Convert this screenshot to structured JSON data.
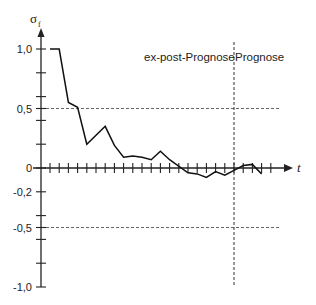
{
  "chart_data": {
    "type": "line",
    "title": "",
    "xlabel": "t",
    "ylabel": "σ_f",
    "ylabel_main": "σ",
    "ylabel_sub": "f",
    "ylim": [
      -1.0,
      1.0
    ],
    "y_tick_labels": [
      "1,0",
      "0,5",
      "0",
      "-0,2",
      "-0,5",
      "-1,0"
    ],
    "y_tick_values": [
      1.0,
      0.5,
      0,
      -0.2,
      -0.5,
      -1.0
    ],
    "y_minor_ticks": [
      0.8,
      0.6,
      0.4,
      0.2,
      -0.4,
      -0.6,
      -0.8
    ],
    "x_tick_count": 25,
    "grid": false,
    "reference_lines": [
      {
        "orientation": "horizontal",
        "value": 0.5,
        "style": "dashed"
      },
      {
        "orientation": "horizontal",
        "value": -0.5,
        "style": "dashed"
      },
      {
        "orientation": "vertical",
        "x_index": 20,
        "style": "dashed",
        "label": "boundary"
      }
    ],
    "annotations": [
      "ex-post-Prognose",
      "Prognose"
    ],
    "series": [
      {
        "name": "σ_f",
        "x": [
          0,
          1,
          2,
          3,
          4,
          6,
          7,
          8,
          9,
          10,
          11,
          12,
          13,
          15,
          16,
          17,
          18,
          19,
          20,
          21,
          22,
          23
        ],
        "values": [
          1.0,
          1.0,
          0.55,
          0.51,
          0.2,
          0.35,
          0.19,
          0.09,
          0.1,
          0.09,
          0.07,
          0.14,
          0.07,
          -0.04,
          -0.05,
          -0.08,
          -0.03,
          -0.06,
          -0.02,
          0.02,
          0.03,
          -0.05
        ]
      }
    ]
  },
  "labels": {
    "ex_post": "ex-post-Prognose",
    "prognose": "Prognose",
    "x_axis": "t"
  }
}
